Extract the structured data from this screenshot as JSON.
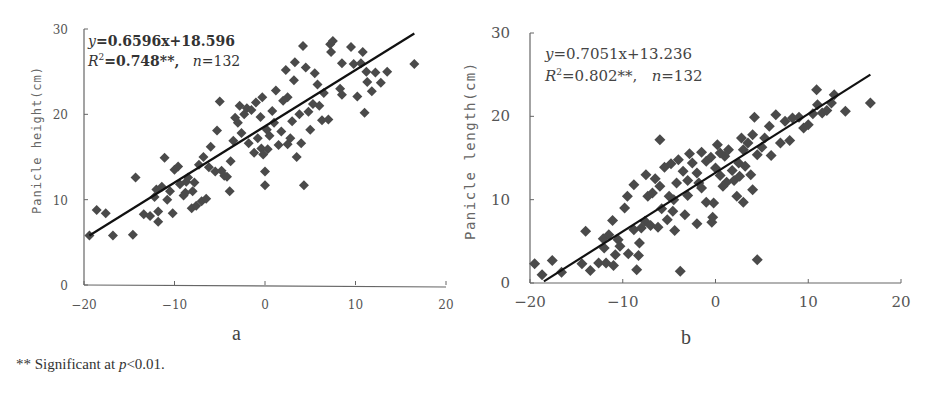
{
  "footnote": {
    "prefix": "** Significant at ",
    "p_symbol": "p",
    "suffix": "<0.01."
  },
  "chart_data": [
    {
      "type": "scatter",
      "panel": "a",
      "title": "",
      "xlabel": "",
      "ylabel": "Panicle height(cm)",
      "xlim": [
        -20,
        20
      ],
      "ylim": [
        0,
        30
      ],
      "xticks": [
        "-20",
        "-10",
        "0",
        "10",
        "20"
      ],
      "yticks": [
        "0",
        "10",
        "20",
        "30"
      ],
      "grid": false,
      "legend": null,
      "annotation": {
        "equation_y": "y",
        "equation_rest": "=0.6596x+18.596",
        "r2_label": "R",
        "r2_sup": "2",
        "r2_value": "=0.748**,",
        "n_label": "n",
        "n_value": "=132"
      },
      "regression": {
        "slope": 0.6596,
        "intercept": 18.596,
        "r2": 0.748,
        "n": 132,
        "x_range": [
          -19.4,
          16.5
        ]
      },
      "points": [
        [
          -19.4,
          5.8
        ],
        [
          -18.6,
          8.8
        ],
        [
          -17.6,
          8.4
        ],
        [
          -16.8,
          5.8
        ],
        [
          -14.6,
          5.9
        ],
        [
          -14.3,
          12.6
        ],
        [
          -13.4,
          8.3
        ],
        [
          -12.7,
          8.1
        ],
        [
          -12.2,
          10.3
        ],
        [
          -12.0,
          11.2
        ],
        [
          -11.8,
          7.4
        ],
        [
          -11.8,
          8.6
        ],
        [
          -11.4,
          11.5
        ],
        [
          -11.1,
          14.9
        ],
        [
          -10.8,
          10.0
        ],
        [
          -10.2,
          8.4
        ],
        [
          -10.0,
          13.5
        ],
        [
          -9.6,
          13.9
        ],
        [
          -9.4,
          11.8
        ],
        [
          -9.0,
          10.5
        ],
        [
          -8.7,
          12.1
        ],
        [
          -8.5,
          12.6
        ],
        [
          -8.1,
          9.0
        ],
        [
          -8.0,
          11.0
        ],
        [
          -7.8,
          12.0
        ],
        [
          -7.6,
          9.3
        ],
        [
          -7.3,
          14.1
        ],
        [
          -7.0,
          9.8
        ],
        [
          -6.5,
          10.1
        ],
        [
          -6.2,
          13.8
        ],
        [
          -6.0,
          16.2
        ],
        [
          -5.3,
          18.1
        ],
        [
          -5.0,
          21.5
        ],
        [
          -4.8,
          13.4
        ],
        [
          -4.5,
          12.8
        ],
        [
          -4.2,
          12.7
        ],
        [
          -3.9,
          11.0
        ],
        [
          -3.8,
          14.5
        ],
        [
          -3.5,
          16.9
        ],
        [
          -3.3,
          19.6
        ],
        [
          -3.0,
          19.0
        ],
        [
          -2.6,
          17.8
        ],
        [
          -2.3,
          20.0
        ],
        [
          -2.0,
          20.7
        ],
        [
          -1.8,
          16.6
        ],
        [
          -1.5,
          20.5
        ],
        [
          -1.2,
          15.5
        ],
        [
          -1.0,
          21.4
        ],
        [
          -0.8,
          17.2
        ],
        [
          -0.5,
          19.7
        ],
        [
          -0.4,
          16.0
        ],
        [
          -0.2,
          15.3
        ],
        [
          0.0,
          13.3
        ],
        [
          0.0,
          11.7
        ],
        [
          0.2,
          18.2
        ],
        [
          0.5,
          17.5
        ],
        [
          0.8,
          20.4
        ],
        [
          1.2,
          22.8
        ],
        [
          1.5,
          16.4
        ],
        [
          1.8,
          18.0
        ],
        [
          2.0,
          21.6
        ],
        [
          2.3,
          25.2
        ],
        [
          2.5,
          22.0
        ],
        [
          2.5,
          16.5
        ],
        [
          2.8,
          17.2
        ],
        [
          3.0,
          19.2
        ],
        [
          3.2,
          24.0
        ],
        [
          3.3,
          26.1
        ],
        [
          3.5,
          15.0
        ],
        [
          3.8,
          20.0
        ],
        [
          4.0,
          16.6
        ],
        [
          4.2,
          28.0
        ],
        [
          4.3,
          11.7
        ],
        [
          4.5,
          25.5
        ],
        [
          4.8,
          20.3
        ],
        [
          5.0,
          18.2
        ],
        [
          5.3,
          21.2
        ],
        [
          5.5,
          24.8
        ],
        [
          5.8,
          23.5
        ],
        [
          6.0,
          21.0
        ],
        [
          6.3,
          19.3
        ],
        [
          6.5,
          22.5
        ],
        [
          7.0,
          19.4
        ],
        [
          7.2,
          28.2
        ],
        [
          7.5,
          28.6
        ],
        [
          7.3,
          27.3
        ],
        [
          8.3,
          23.0
        ],
        [
          8.5,
          22.3
        ],
        [
          8.5,
          26.0
        ],
        [
          9.5,
          27.9
        ],
        [
          9.8,
          25.9
        ],
        [
          10.2,
          22.1
        ],
        [
          10.6,
          26.0
        ],
        [
          10.8,
          27.3
        ],
        [
          11.0,
          20.2
        ],
        [
          11.2,
          25.0
        ],
        [
          11.3,
          23.8
        ],
        [
          11.8,
          22.7
        ],
        [
          12.2,
          24.9
        ],
        [
          12.8,
          23.7
        ],
        [
          13.5,
          25.0
        ],
        [
          16.5,
          25.9
        ],
        [
          -0.3,
          22.0
        ],
        [
          1.0,
          19.0
        ],
        [
          -2.8,
          21.0
        ],
        [
          0.3,
          15.9
        ],
        [
          -6.8,
          15.0
        ],
        [
          -5.5,
          13.3
        ],
        [
          -8.8,
          10.8
        ],
        [
          -10.5,
          11.0
        ]
      ]
    },
    {
      "type": "scatter",
      "panel": "b",
      "title": "",
      "xlabel": "",
      "ylabel": "Panicle length(cm)",
      "xlim": [
        -20,
        20
      ],
      "ylim": [
        0,
        30
      ],
      "xticks": [
        "-20",
        "-10",
        "0",
        "10",
        "20"
      ],
      "yticks": [
        "0",
        "10",
        "20",
        "30"
      ],
      "grid": false,
      "legend": null,
      "annotation": {
        "equation_y": "y",
        "equation_rest": "=0.7051x+13.236",
        "r2_label": "R",
        "r2_sup": "2",
        "r2_value": "=0.802**,",
        "n_label": "n",
        "n_value": "=132"
      },
      "regression": {
        "slope": 0.7051,
        "intercept": 13.236,
        "r2": 0.802,
        "n": 132,
        "x_range": [
          -18.5,
          16.7
        ]
      },
      "points": [
        [
          -19.5,
          2.3
        ],
        [
          -18.7,
          1.0
        ],
        [
          -17.6,
          2.7
        ],
        [
          -16.6,
          1.3
        ],
        [
          -14.4,
          2.3
        ],
        [
          -14.0,
          6.2
        ],
        [
          -13.5,
          1.5
        ],
        [
          -12.6,
          2.4
        ],
        [
          -12.1,
          5.3
        ],
        [
          -12.0,
          4.2
        ],
        [
          -11.8,
          2.4
        ],
        [
          -11.5,
          5.8
        ],
        [
          -11.1,
          7.5
        ],
        [
          -11.0,
          2.1
        ],
        [
          -10.8,
          3.4
        ],
        [
          -10.5,
          5.2
        ],
        [
          -10.3,
          4.4
        ],
        [
          -9.8,
          9.0
        ],
        [
          -9.4,
          3.5
        ],
        [
          -8.8,
          6.4
        ],
        [
          -8.5,
          1.6
        ],
        [
          -8.3,
          3.3
        ],
        [
          -8.2,
          4.8
        ],
        [
          -8.0,
          6.6
        ],
        [
          -7.6,
          7.4
        ],
        [
          -7.3,
          10.4
        ],
        [
          -7.0,
          6.9
        ],
        [
          -6.2,
          6.7
        ],
        [
          -6.0,
          11.6
        ],
        [
          -5.8,
          8.9
        ],
        [
          -5.2,
          7.6
        ],
        [
          -5.0,
          10.4
        ],
        [
          -4.4,
          6.3
        ],
        [
          -4.6,
          8.6
        ],
        [
          -3.8,
          1.4
        ],
        [
          -4.2,
          12.0
        ],
        [
          -3.3,
          8.2
        ],
        [
          -3.0,
          12.3
        ],
        [
          -2.0,
          7.1
        ],
        [
          -1.5,
          11.4
        ],
        [
          -1.0,
          9.7
        ],
        [
          -0.4,
          7.3
        ],
        [
          -0.2,
          9.6
        ],
        [
          -0.3,
          7.9
        ],
        [
          0.0,
          13.8
        ],
        [
          0.5,
          12.9
        ],
        [
          1.0,
          15.2
        ],
        [
          1.2,
          12.1
        ],
        [
          1.8,
          13.5
        ],
        [
          2.0,
          12.3
        ],
        [
          2.3,
          10.4
        ],
        [
          2.5,
          14.4
        ],
        [
          2.6,
          12.8
        ],
        [
          3.0,
          16.0
        ],
        [
          3.2,
          14.0
        ],
        [
          3.5,
          16.8
        ],
        [
          3.8,
          13.0
        ],
        [
          4.0,
          17.8
        ],
        [
          4.0,
          11.2
        ],
        [
          4.2,
          19.9
        ],
        [
          4.5,
          2.8
        ],
        [
          4.5,
          15.4
        ],
        [
          5.0,
          16.3
        ],
        [
          5.3,
          17.4
        ],
        [
          5.8,
          18.8
        ],
        [
          6.0,
          15.3
        ],
        [
          6.5,
          20.2
        ],
        [
          7.0,
          16.8
        ],
        [
          7.5,
          19.4
        ],
        [
          8.0,
          17.1
        ],
        [
          8.3,
          19.8
        ],
        [
          9.0,
          19.9
        ],
        [
          9.5,
          18.6
        ],
        [
          10.0,
          19.0
        ],
        [
          10.5,
          20.3
        ],
        [
          10.9,
          23.2
        ],
        [
          11.0,
          21.4
        ],
        [
          11.5,
          20.4
        ],
        [
          12.0,
          20.7
        ],
        [
          12.5,
          21.6
        ],
        [
          12.8,
          22.6
        ],
        [
          14.0,
          20.6
        ],
        [
          16.7,
          21.6
        ],
        [
          -6.0,
          17.2
        ],
        [
          -7.5,
          13.0
        ],
        [
          -6.5,
          12.5
        ],
        [
          -5.5,
          13.9
        ],
        [
          -4.8,
          14.3
        ],
        [
          -4.0,
          14.8
        ],
        [
          -3.5,
          13.4
        ],
        [
          -2.8,
          15.5
        ],
        [
          -2.5,
          14.4
        ],
        [
          -2.0,
          13.2
        ],
        [
          -1.5,
          15.7
        ],
        [
          -1.0,
          14.6
        ],
        [
          -0.5,
          15.1
        ],
        [
          0.2,
          16.6
        ],
        [
          0.5,
          15.6
        ],
        [
          1.4,
          16.0
        ],
        [
          2.8,
          17.4
        ],
        [
          -8.8,
          11.8
        ],
        [
          -9.5,
          10.4
        ],
        [
          -6.8,
          10.8
        ],
        [
          -4.5,
          10.0
        ],
        [
          -3.0,
          10.5
        ],
        [
          -1.8,
          12.0
        ],
        [
          0.8,
          11.6
        ],
        [
          3.0,
          9.7
        ]
      ]
    }
  ]
}
